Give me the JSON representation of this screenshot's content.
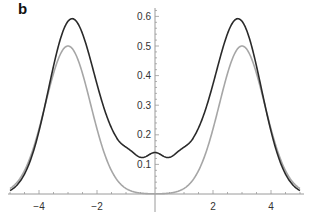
{
  "panel_label": "b",
  "colors": {
    "dark_curve": "#2a2a2a",
    "light_curve": "#a6a6a6",
    "axis": "#9a9a9a",
    "tick_text": "#333333"
  },
  "chart_data": {
    "type": "line",
    "title": "",
    "panel": "b",
    "xlabel": "",
    "ylabel": "",
    "xlim": [
      -5,
      5
    ],
    "ylim": [
      0,
      0.62
    ],
    "grid": false,
    "legend": null,
    "x_ticks": [
      -4,
      -2,
      2,
      4
    ],
    "x_tick_labels": [
      "-4",
      "-2",
      "2",
      "4"
    ],
    "y_ticks": [
      0.1,
      0.2,
      0.3,
      0.4,
      0.5,
      0.6
    ],
    "y_tick_labels": [
      "0.1",
      "0.2",
      "0.3",
      "0.4",
      "0.5",
      "0.6"
    ],
    "axes_origin": [
      0,
      0
    ],
    "series": [
      {
        "name": "dark curve",
        "color": "#2a2a2a",
        "x": [
          -5,
          -4.5,
          -4,
          -3.5,
          -3,
          -2.5,
          -2,
          -1.5,
          -1,
          -0.75,
          -0.5,
          -0.25,
          0,
          0.25,
          0.5,
          0.75,
          1,
          1.5,
          2,
          2.5,
          3,
          3.5,
          4,
          4.5,
          5
        ],
        "values": [
          0.005,
          0.09,
          0.3,
          0.52,
          0.585,
          0.52,
          0.36,
          0.22,
          0.165,
          0.135,
          0.148,
          0.132,
          0.125,
          0.132,
          0.148,
          0.135,
          0.165,
          0.22,
          0.36,
          0.52,
          0.585,
          0.52,
          0.3,
          0.09,
          0.005
        ]
      },
      {
        "name": "light curve",
        "color": "#a6a6a6",
        "x": [
          -5,
          -4.5,
          -4,
          -3.5,
          -3,
          -2.5,
          -2,
          -1.5,
          -1,
          -0.5,
          0,
          0.5,
          1,
          1.5,
          2,
          2.5,
          3,
          3.5,
          4,
          4.5,
          5
        ],
        "values": [
          0.01,
          0.11,
          0.31,
          0.47,
          0.5,
          0.42,
          0.25,
          0.1,
          0.03,
          0.003,
          0.0,
          0.003,
          0.03,
          0.1,
          0.25,
          0.42,
          0.5,
          0.47,
          0.31,
          0.11,
          0.01
        ]
      }
    ]
  }
}
